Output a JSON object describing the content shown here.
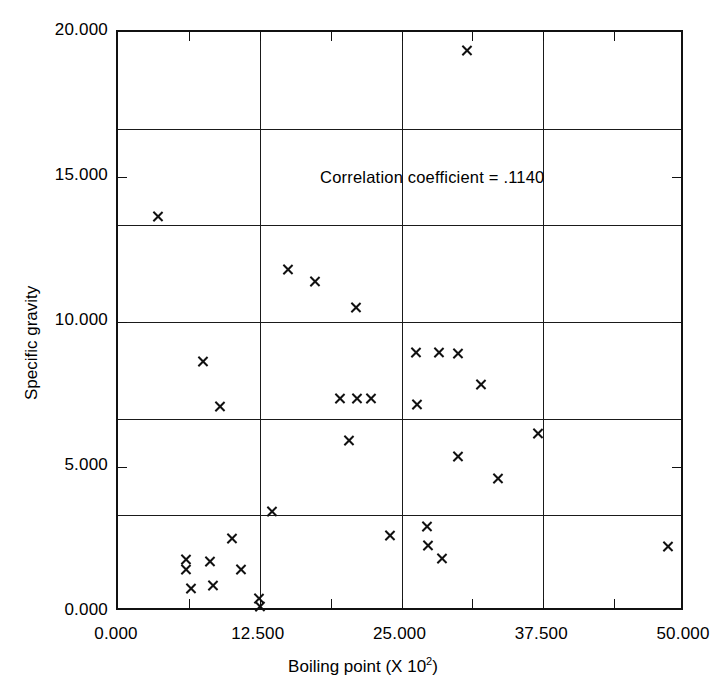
{
  "chart_data": {
    "type": "scatter",
    "title": "",
    "xlabel": "Boiling point (X 10",
    "xlabel_sup": "2",
    "xlabel_tail": ")",
    "ylabel": "Specific gravity",
    "xlim": [
      0.0,
      50.0
    ],
    "ylim": [
      0.0,
      20.0
    ],
    "xticks": [
      0.0,
      12.5,
      25.0,
      37.5,
      50.0
    ],
    "yticks": [
      0.0,
      5.0,
      10.0,
      15.0,
      20.0
    ],
    "xtick_labels": [
      "0.000",
      "12.500",
      "25.000",
      "37.500",
      "50.000"
    ],
    "ytick_labels": [
      "0.000",
      "5.000",
      "10.000",
      "15.000",
      "20.000"
    ],
    "grid": true,
    "grid_x": [
      12.5,
      25.0,
      37.5
    ],
    "grid_y": [
      3.33,
      6.67,
      10.0,
      13.33,
      16.67
    ],
    "legend": "none",
    "marker": "x",
    "marker_color": "#111111",
    "annotation": "Correlation coefficient = .1140",
    "annotation_x": 18.0,
    "annotation_y": 14.9,
    "points": [
      {
        "x": 3.5,
        "y": 13.65
      },
      {
        "x": 7.5,
        "y": 8.65
      },
      {
        "x": 9.0,
        "y": 7.1
      },
      {
        "x": 15.0,
        "y": 11.8
      },
      {
        "x": 17.4,
        "y": 11.4
      },
      {
        "x": 21.0,
        "y": 10.5
      },
      {
        "x": 19.6,
        "y": 7.35
      },
      {
        "x": 21.1,
        "y": 7.35
      },
      {
        "x": 22.3,
        "y": 7.35
      },
      {
        "x": 20.4,
        "y": 5.9
      },
      {
        "x": 26.3,
        "y": 8.95
      },
      {
        "x": 28.3,
        "y": 8.95
      },
      {
        "x": 30.0,
        "y": 8.9
      },
      {
        "x": 32.0,
        "y": 7.85
      },
      {
        "x": 26.4,
        "y": 7.15
      },
      {
        "x": 30.0,
        "y": 5.35
      },
      {
        "x": 33.5,
        "y": 4.6
      },
      {
        "x": 37.0,
        "y": 6.15
      },
      {
        "x": 30.8,
        "y": 19.35
      },
      {
        "x": 13.6,
        "y": 3.45
      },
      {
        "x": 24.0,
        "y": 2.65
      },
      {
        "x": 27.2,
        "y": 2.95
      },
      {
        "x": 27.3,
        "y": 2.3
      },
      {
        "x": 28.6,
        "y": 1.85
      },
      {
        "x": 48.5,
        "y": 2.25
      },
      {
        "x": 10.0,
        "y": 2.55
      },
      {
        "x": 8.1,
        "y": 1.75
      },
      {
        "x": 10.8,
        "y": 1.45
      },
      {
        "x": 6.0,
        "y": 1.8
      },
      {
        "x": 6.0,
        "y": 1.45
      },
      {
        "x": 6.4,
        "y": 0.8
      },
      {
        "x": 8.4,
        "y": 0.9
      },
      {
        "x": 12.4,
        "y": 0.45
      },
      {
        "x": 12.5,
        "y": 0.2
      }
    ]
  }
}
